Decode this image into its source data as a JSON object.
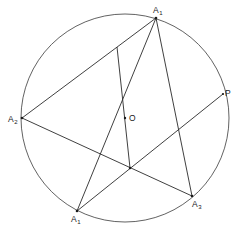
{
  "diagram": {
    "type": "geometry-figure",
    "colors": {
      "line": "#2a2a2a",
      "background": "#ffffff"
    },
    "circle": {
      "cx": 125,
      "cy": 118,
      "r": 104
    },
    "points": {
      "A1": {
        "x": 156,
        "y": 18,
        "label": "A",
        "sub": "1"
      },
      "A2": {
        "x": 22,
        "y": 118,
        "label": "A",
        "sub": "2"
      },
      "A3": {
        "x": 192,
        "y": 196,
        "label": "A",
        "sub": "3"
      },
      "A1p": {
        "x": 77,
        "y": 211,
        "label": "A",
        "sub": "1"
      },
      "P": {
        "x": 223,
        "y": 94,
        "label": "P"
      },
      "O": {
        "x": 125,
        "y": 118,
        "label": "O"
      },
      "Q": {
        "x": 117,
        "y": 47
      },
      "X": {
        "x": 130,
        "y": 168
      }
    },
    "labels": {
      "A1": "A",
      "A1_sub": "1",
      "A2": "A",
      "A2_sub": "2",
      "A3": "A",
      "A3_sub": "3",
      "A1p": "A",
      "A1p_sub": "1",
      "P": "P",
      "O": "O"
    },
    "segments": [
      {
        "from": "A1",
        "to": "A2"
      },
      {
        "from": "A1",
        "to": "A3"
      },
      {
        "from": "A1",
        "to": "A1p"
      },
      {
        "from": "A2",
        "to": "A3"
      },
      {
        "from": "A1p",
        "to": "P"
      },
      {
        "from": "Q",
        "to": "X"
      }
    ]
  }
}
